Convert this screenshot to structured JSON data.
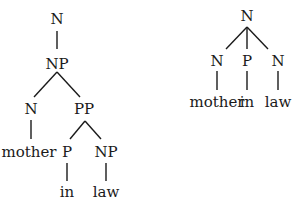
{
  "trees": {
    "left": {
      "root": "N",
      "np": "NP",
      "n": "N",
      "pp": "PP",
      "mother": "mother",
      "p": "P",
      "np2": "NP",
      "in": "in",
      "law": "law"
    },
    "right": {
      "root": "N",
      "n1": "N",
      "p": "P",
      "n2": "N",
      "mother": "mother",
      "in": "in",
      "law": "law"
    }
  }
}
